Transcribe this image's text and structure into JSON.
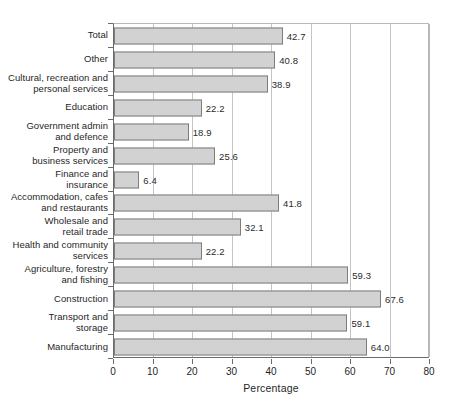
{
  "chart_data": {
    "type": "bar",
    "orientation": "horizontal",
    "title": "",
    "xlabel": "Percentage",
    "ylabel": "",
    "xlim": [
      0,
      80
    ],
    "xticks": [
      0,
      10,
      20,
      30,
      40,
      50,
      60,
      70,
      80
    ],
    "grid": "vertical",
    "legend": "none",
    "categories": [
      "Total",
      "Other",
      "Cultural, recreation and personal services",
      "Education",
      "Government admin and defence",
      "Property and business services",
      "Finance and insurance",
      "Accommodation, cafes and restaurants",
      "Wholesale and retail trade",
      "Health and community services",
      "Agriculture, forestry and fishing",
      "Construction",
      "Transport and storage",
      "Manufacturing"
    ],
    "values": [
      42.7,
      40.8,
      38.9,
      22.2,
      18.9,
      25.6,
      6.4,
      41.8,
      32.1,
      22.2,
      59.3,
      67.6,
      59.1,
      64.0
    ]
  },
  "bars": [
    {
      "label_lines": [
        "Total"
      ],
      "value": 42.7,
      "value_text": "42.7"
    },
    {
      "label_lines": [
        "Other"
      ],
      "value": 40.8,
      "value_text": "40.8"
    },
    {
      "label_lines": [
        "Cultural, recreation and",
        "personal services"
      ],
      "value": 38.9,
      "value_text": "38.9"
    },
    {
      "label_lines": [
        "Education"
      ],
      "value": 22.2,
      "value_text": "22.2"
    },
    {
      "label_lines": [
        "Government admin",
        "and defence"
      ],
      "value": 18.9,
      "value_text": "18.9"
    },
    {
      "label_lines": [
        "Property and",
        "business services"
      ],
      "value": 25.6,
      "value_text": "25.6"
    },
    {
      "label_lines": [
        "Finance and",
        "insurance"
      ],
      "value": 6.4,
      "value_text": "6.4"
    },
    {
      "label_lines": [
        "Accommodation, cafes",
        "and restaurants"
      ],
      "value": 41.8,
      "value_text": "41.8"
    },
    {
      "label_lines": [
        "Wholesale and",
        "retail trade"
      ],
      "value": 32.1,
      "value_text": "32.1"
    },
    {
      "label_lines": [
        "Health and community",
        "services"
      ],
      "value": 22.2,
      "value_text": "22.2"
    },
    {
      "label_lines": [
        "Agriculture, forestry",
        "and fishing"
      ],
      "value": 59.3,
      "value_text": "59.3"
    },
    {
      "label_lines": [
        "Construction"
      ],
      "value": 67.6,
      "value_text": "67.6"
    },
    {
      "label_lines": [
        "Transport and",
        "storage"
      ],
      "value": 59.1,
      "value_text": "59.1"
    },
    {
      "label_lines": [
        "Manufacturing"
      ],
      "value": 64.0,
      "value_text": "64.0"
    }
  ],
  "axis": {
    "x_title": "Percentage",
    "x_tick_labels": [
      "0",
      "10",
      "20",
      "30",
      "40",
      "50",
      "60",
      "70",
      "80"
    ]
  },
  "colors": {
    "bar_fill": "#d2d2d2",
    "bar_border": "#7d7d7d",
    "gridline": "#c4c4c4",
    "axis_line": "#6b6b6b",
    "text": "#1f1f1f",
    "background": "#ffffff"
  }
}
